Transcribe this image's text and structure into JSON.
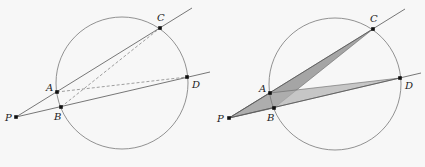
{
  "figures": [
    {
      "id": "left",
      "circle": {
        "cx": 122,
        "cy": 83,
        "r": 66
      },
      "points": {
        "P": {
          "x": 16,
          "y": 117,
          "label": "P",
          "lx": 5,
          "ly": 121
        },
        "A": {
          "x": 57,
          "y": 92,
          "label": "A",
          "lx": 46,
          "ly": 91
        },
        "B": {
          "x": 61,
          "y": 107,
          "label": "B",
          "lx": 54,
          "ly": 120
        },
        "C": {
          "x": 160,
          "y": 28,
          "label": "C",
          "lx": 157,
          "ly": 21
        },
        "D": {
          "x": 187,
          "y": 77,
          "label": "D",
          "lx": 192,
          "ly": 88
        }
      },
      "secants": [
        {
          "from": "P",
          "to": {
            "x": 192,
            "y": 8
          }
        },
        {
          "from": "P",
          "to": {
            "x": 210,
            "y": 72
          }
        }
      ],
      "dashed": [
        [
          "A",
          "D"
        ],
        [
          "B",
          "C"
        ]
      ]
    },
    {
      "id": "right",
      "circle": {
        "cx": 335,
        "cy": 84,
        "r": 66
      },
      "points": {
        "P": {
          "x": 229,
          "y": 118,
          "label": "P",
          "lx": 217,
          "ly": 122
        },
        "A": {
          "x": 270,
          "y": 93,
          "label": "A",
          "lx": 259,
          "ly": 92
        },
        "B": {
          "x": 274,
          "y": 108,
          "label": "B",
          "lx": 267,
          "ly": 121
        },
        "C": {
          "x": 373,
          "y": 29,
          "label": "C",
          "lx": 370,
          "ly": 22
        },
        "D": {
          "x": 400,
          "y": 78,
          "label": "D",
          "lx": 405,
          "ly": 89
        }
      },
      "secants": [
        {
          "from": "P",
          "to": {
            "x": 405,
            "y": 9
          }
        },
        {
          "from": "P",
          "to": {
            "x": 421,
            "y": 73
          }
        }
      ],
      "shaded": [
        {
          "name": "triangle-PCB",
          "vertices": [
            "P",
            "C",
            "B"
          ],
          "fill": "#8a8a8a",
          "opacity": 0.75
        },
        {
          "name": "triangle-PAD",
          "vertices": [
            "P",
            "A",
            "D"
          ],
          "fill": "#b0b0b0",
          "opacity": 0.7
        }
      ]
    }
  ],
  "colors": {
    "line": "#555555",
    "circle": "#777777",
    "dashed": "#777777",
    "point": "#111111"
  }
}
